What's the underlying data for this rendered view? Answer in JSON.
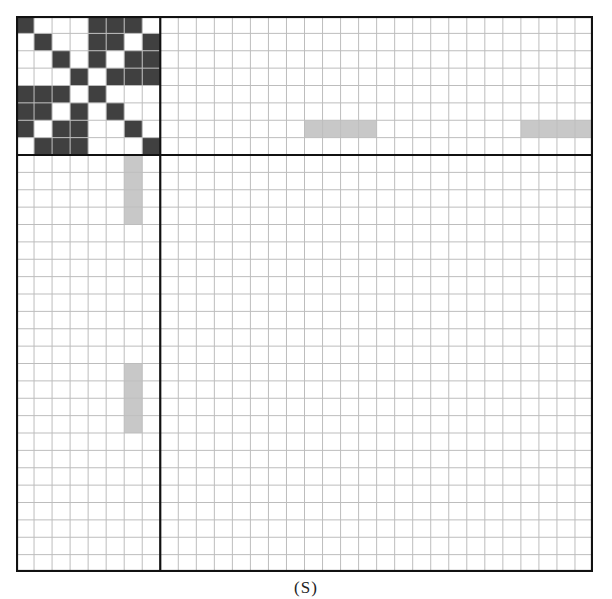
{
  "figure": {
    "caption": "(S)",
    "grid": {
      "rows": 32,
      "cols": 32,
      "block_divider": {
        "row": 8,
        "col": 8
      },
      "colors": {
        "filled": "#404040",
        "highlight": "#c8c8c8",
        "gridline": "#bdbdbd",
        "border": "#111111",
        "background": "#ffffff"
      },
      "pattern_8x8": [
        [
          1,
          0,
          0,
          0,
          1,
          1,
          1,
          0
        ],
        [
          0,
          1,
          0,
          0,
          1,
          1,
          0,
          1
        ],
        [
          0,
          0,
          1,
          0,
          1,
          0,
          1,
          1
        ],
        [
          0,
          0,
          0,
          1,
          0,
          1,
          1,
          1
        ],
        [
          1,
          1,
          1,
          0,
          1,
          0,
          0,
          0
        ],
        [
          1,
          1,
          0,
          1,
          0,
          1,
          0,
          0
        ],
        [
          1,
          0,
          1,
          1,
          0,
          0,
          1,
          0
        ],
        [
          0,
          1,
          1,
          1,
          0,
          0,
          0,
          1
        ]
      ],
      "highlight_runs": [
        {
          "orientation": "horizontal",
          "row": 6,
          "col_start": 16,
          "length": 4
        },
        {
          "orientation": "horizontal",
          "row": 6,
          "col_start": 28,
          "length": 4
        },
        {
          "orientation": "vertical",
          "col": 6,
          "row_start": 8,
          "length": 4
        },
        {
          "orientation": "vertical",
          "col": 6,
          "row_start": 20,
          "length": 4
        }
      ]
    }
  }
}
